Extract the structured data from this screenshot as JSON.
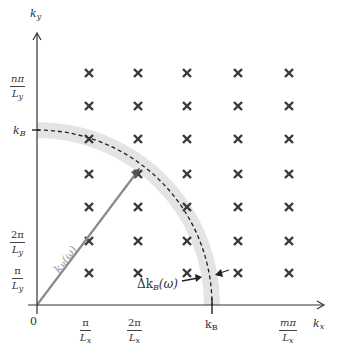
{
  "diagram": {
    "type": "reciprocal-lattice-quarter-circle",
    "axes": {
      "x": {
        "label_main": "k",
        "label_sub": "x"
      },
      "y": {
        "label_main": "k",
        "label_sub": "y"
      }
    },
    "origin_label": "0",
    "x_ticks": [
      {
        "num": "π",
        "den_main": "L",
        "den_sub": "x"
      },
      {
        "num": "2π",
        "den_main": "L",
        "den_sub": "x"
      },
      {
        "num": "mπ",
        "den_main": "L",
        "den_sub": "x"
      }
    ],
    "y_ticks": [
      {
        "num": "π",
        "den_main": "L",
        "den_sub": "y"
      },
      {
        "num": "2π",
        "den_main": "L",
        "den_sub": "y"
      },
      {
        "num": "nπ",
        "den_main": "L",
        "den_sub": "y"
      }
    ],
    "kB_x_label": {
      "main": "k",
      "sub": "B"
    },
    "kB_y_label": {
      "main": "k",
      "sub": "B"
    },
    "radius_label": {
      "main": "k",
      "sub": "B",
      "arg": "(ω)"
    },
    "shell_label": {
      "prefix": "Δk",
      "sub": "B",
      "arg": "(ω)"
    },
    "lattice": {
      "columns": 5,
      "rows": 7,
      "marker": "×",
      "marker_color": "#3a3a3a"
    },
    "colors": {
      "axis": "#333333",
      "band": "#e4e4e4",
      "dashed_arc": "#222222",
      "radius_line": "#8a8a8a"
    }
  }
}
